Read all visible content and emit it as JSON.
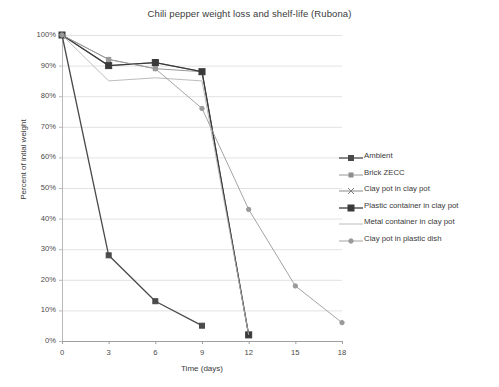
{
  "chart_data": {
    "type": "line",
    "title": "Chili pepper weight loss and shelf-life (Rubona)",
    "xlabel": "Time (days)",
    "ylabel": "Percent of intial weight",
    "x": [
      0,
      3,
      6,
      9,
      12,
      15,
      18
    ],
    "xlim": [
      0,
      18
    ],
    "ylim": [
      0,
      100
    ],
    "xticks": [
      "0",
      "3",
      "6",
      "9",
      "12",
      "15",
      "18"
    ],
    "yticks": [
      "0%",
      "10%",
      "20%",
      "30%",
      "40%",
      "50%",
      "60%",
      "70%",
      "80%",
      "90%",
      "100%"
    ],
    "grid": "horizontal",
    "legend_position": "right",
    "series": [
      {
        "name": "Ambient",
        "color": "#4a4a4a",
        "marker": "square",
        "x": [
          0,
          3,
          6,
          9
        ],
        "values": [
          100,
          28,
          13,
          5
        ]
      },
      {
        "name": "Brick ZECC",
        "color": "#8d8d8d",
        "marker": "square-small",
        "x": [
          0,
          3,
          6,
          9,
          12
        ],
        "values": [
          100,
          92,
          89,
          88,
          2
        ]
      },
      {
        "name": "Clay pot in clay pot",
        "color": "#7d7d7d",
        "marker": "cross",
        "x": [
          0,
          3,
          6,
          9,
          12
        ],
        "values": [
          100,
          90,
          91,
          88,
          2
        ]
      },
      {
        "name": "Plastic container in clay pot",
        "color": "#3a3a3a",
        "marker": "square-filled",
        "x": [
          0,
          3,
          6,
          9,
          12
        ],
        "values": [
          100,
          90,
          91,
          88,
          2
        ]
      },
      {
        "name": "Metal container in clay pot",
        "color": "#b4b4b4",
        "marker": "none",
        "x": [
          0,
          3,
          6,
          9,
          12
        ],
        "values": [
          100,
          85,
          86,
          85,
          2
        ]
      },
      {
        "name": "Clay pot in plastic dish",
        "color": "#9a9a9a",
        "marker": "dot",
        "x": [
          0,
          3,
          6,
          9,
          12,
          15,
          18
        ],
        "values": [
          100,
          92,
          89,
          76,
          43,
          18,
          6
        ]
      }
    ]
  }
}
